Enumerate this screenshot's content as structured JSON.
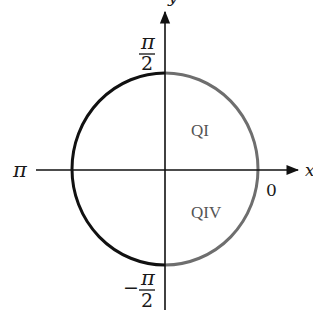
{
  "diagram": {
    "type": "unit-circle",
    "axes": {
      "x_label": "x",
      "y_label": "y"
    },
    "angle_labels": {
      "top": {
        "numerator": "π",
        "denominator": "2",
        "sign": ""
      },
      "bottom": {
        "numerator": "π",
        "denominator": "2",
        "sign": "−"
      },
      "left": "π",
      "right": "0"
    },
    "quadrant_labels": {
      "q1": "QI",
      "q4": "QIV"
    },
    "colors": {
      "left_half_arc": "#111111",
      "right_half_arc": "#6e6e6e",
      "axes": "#111111",
      "quadrant_text": "#555555"
    }
  }
}
